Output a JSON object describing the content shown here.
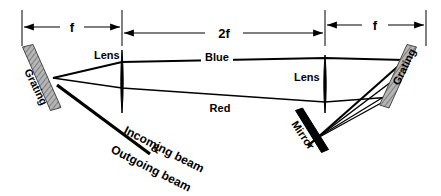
{
  "figure": {
    "background_color": "#ffffff",
    "line_color": "#000000",
    "hatch_color": "#8a8a8a"
  },
  "dimensions": [
    {
      "id": "f-left",
      "label": "f",
      "x_start": 22,
      "x_end": 122,
      "y": 27
    },
    {
      "id": "two-f",
      "label": "2f",
      "x_start": 122,
      "x_end": 325,
      "y": 33
    },
    {
      "id": "f-right",
      "label": "f",
      "x_start": 325,
      "x_end": 426,
      "y": 25
    }
  ],
  "tick_lines": [
    {
      "id": "tick-1",
      "x": 22,
      "y_top": 10,
      "y_bottom": 46
    },
    {
      "id": "tick-2",
      "x": 122,
      "y_top": 10,
      "y_bottom": 46
    },
    {
      "id": "tick-3",
      "x": 325,
      "y_top": 10,
      "y_bottom": 46
    },
    {
      "id": "tick-4",
      "x": 426,
      "y_top": 10,
      "y_bottom": 46
    }
  ],
  "components": [
    {
      "id": "grating-left",
      "label": "Grating",
      "type": "grating",
      "x1": 27,
      "y1": 50,
      "x2": 56,
      "y2": 110,
      "label_x": 26,
      "label_y": 74,
      "label_rotate": 64
    },
    {
      "id": "lens-left",
      "label": "Lens",
      "type": "lens",
      "x": 122,
      "y_top": 50,
      "y_bottom": 113,
      "label_x": 95,
      "label_y": 58
    },
    {
      "id": "lens-right",
      "label": "Lens",
      "type": "lens",
      "x": 325,
      "y_top": 55,
      "y_bottom": 113,
      "label_x": 295,
      "label_y": 80
    },
    {
      "id": "mirror",
      "label": "Mirror",
      "type": "mirror",
      "x1": 298,
      "y1": 112,
      "x2": 326,
      "y2": 152,
      "label_x": 295,
      "label_y": 128,
      "label_rotate": 56
    },
    {
      "id": "grating-right",
      "label": "Grating",
      "type": "grating",
      "x1": 412,
      "y1": 49,
      "x2": 384,
      "y2": 107,
      "label_x": 398,
      "label_y": 90,
      "label_rotate": -64
    }
  ],
  "beams": [
    {
      "id": "blue-ray",
      "label": "Blue",
      "label_x": 205,
      "label_y": 62,
      "path": "53,78 122,62 325,58 404,60"
    },
    {
      "id": "red-ray",
      "label": "Red",
      "label_x": 210,
      "label_y": 112,
      "path": "53,78 122,88 325,102 392,97"
    },
    {
      "id": "blue-return",
      "label": "",
      "path": "404,60 310,143"
    },
    {
      "id": "red-return",
      "label": "",
      "path": "392,97 316,138"
    },
    {
      "id": "mirror-return-blue",
      "label": "",
      "path": "310,143 398,78"
    },
    {
      "id": "mirror-return-red",
      "label": "",
      "path": "316,138 390,92"
    }
  ],
  "input_beam": {
    "id": "incoming-outgoing-beam",
    "line": "57,86 150,154",
    "labels": [
      {
        "id": "incoming-beam-label",
        "text": "Incoming beam",
        "x": 128,
        "y": 136,
        "rotate": 27
      },
      {
        "id": "ampersand-label",
        "text": "&",
        "x": 152,
        "y": 153,
        "rotate": 27
      },
      {
        "id": "outgoing-beam-label",
        "text": "Outgoing beam",
        "x": 118,
        "y": 153,
        "rotate": 27
      }
    ]
  }
}
